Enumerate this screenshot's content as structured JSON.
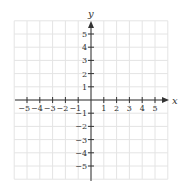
{
  "chart_data": {
    "type": "coordinate-grid",
    "title": "",
    "xlabel": "x",
    "ylabel": "y",
    "xlim": [
      -6,
      6
    ],
    "ylim": [
      -6,
      6
    ],
    "grid": true,
    "x_ticks": [
      -5,
      -4,
      -3,
      -2,
      -1,
      1,
      2,
      3,
      4,
      5
    ],
    "y_ticks": [
      -5,
      -4,
      -3,
      -2,
      -1,
      1,
      2,
      3,
      4,
      5
    ],
    "x_tick_labels": [
      "−5",
      "−4",
      "−3",
      "−2",
      "−1",
      "1",
      "2",
      "3",
      "4",
      "5"
    ],
    "y_tick_labels": [
      "−5",
      "−4",
      "−3",
      "−2",
      "−1",
      "1",
      "2",
      "3",
      "4",
      "5"
    ],
    "arrows": [
      "positive-x",
      "positive-y"
    ],
    "data_points": []
  },
  "colors": {
    "grid": "#e4e4e4",
    "axis": "#333333",
    "background": "#ffffff"
  }
}
